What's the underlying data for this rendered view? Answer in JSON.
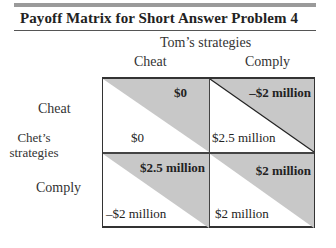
{
  "title": "Payoff Matrix for Short Answer Problem 4",
  "column_player": {
    "label": "Tom’s strategies",
    "strategies": [
      "Cheat",
      "Comply"
    ]
  },
  "row_player": {
    "label": "Chet’s strategies",
    "label_lines": [
      "Chet’s",
      "strategies"
    ],
    "strategies": [
      "Cheat",
      "Comply"
    ]
  },
  "colors": {
    "shade": "#c8c8c8",
    "rule": "#9a9a9a",
    "line": "#333333"
  },
  "matrix": [
    [
      {
        "tom": "$0",
        "chet": "$0"
      },
      {
        "tom": "–$2 million",
        "chet": "$2.5 million"
      }
    ],
    [
      {
        "tom": "$2.5 million",
        "chet": "–$2 million"
      },
      {
        "tom": "$2 million",
        "chet": "$2 million"
      }
    ]
  ]
}
